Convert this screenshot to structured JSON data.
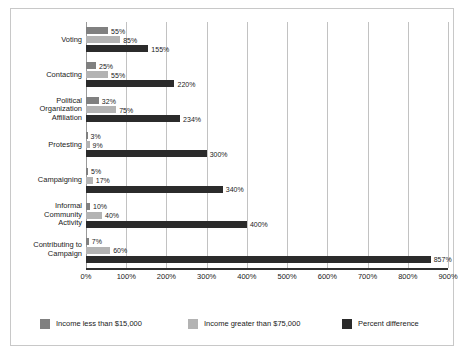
{
  "chart_data": {
    "type": "bar",
    "orientation": "horizontal",
    "title": "",
    "xlabel": "",
    "ylabel": "",
    "xlim": [
      0,
      900
    ],
    "xticks": [
      0,
      100,
      200,
      300,
      400,
      500,
      600,
      700,
      800,
      900
    ],
    "xtick_labels": [
      "0%",
      "100%",
      "200%",
      "300%",
      "400%",
      "500%",
      "600%",
      "700%",
      "800%",
      "900%"
    ],
    "grid": true,
    "grid_axis": "x",
    "legend_position": "bottom",
    "categories": [
      "Voting",
      "Contacting",
      "Political Organization Affiliation",
      "Protesting",
      "Campaigning",
      "Informal Community Activity",
      "Contributing to Campaign"
    ],
    "category_lines": [
      [
        "Voting"
      ],
      [
        "Contacting"
      ],
      [
        "Political",
        "Organization",
        "Affiliation"
      ],
      [
        "Protesting"
      ],
      [
        "Campaigning"
      ],
      [
        "Informal",
        "Community",
        "Activity"
      ],
      [
        "Contributing to",
        "Campaign"
      ]
    ],
    "series": [
      {
        "name": "Income less than $15,000",
        "color": "#808080",
        "values": [
          55,
          25,
          32,
          3,
          5,
          10,
          7
        ],
        "labels": [
          "55%",
          "25%",
          "32%",
          "3%",
          "5%",
          "10%",
          "7%"
        ]
      },
      {
        "name": "Income greater than $75,000",
        "color": "#b3b3b3",
        "values": [
          85,
          55,
          75,
          9,
          17,
          40,
          60
        ],
        "labels": [
          "85%",
          "55%",
          "75%",
          "9%",
          "17%",
          "40%",
          "60%"
        ]
      },
      {
        "name": "Percent difference",
        "color": "#2b2b2b",
        "values": [
          155,
          220,
          234,
          300,
          340,
          400,
          857
        ],
        "labels": [
          "155%",
          "220%",
          "234%",
          "300%",
          "340%",
          "400%",
          "857%"
        ]
      }
    ]
  },
  "legend": {
    "items": [
      {
        "label": "Income less than $15,000"
      },
      {
        "label": "Income greater than $75,000"
      },
      {
        "label": "Percent difference"
      }
    ]
  }
}
